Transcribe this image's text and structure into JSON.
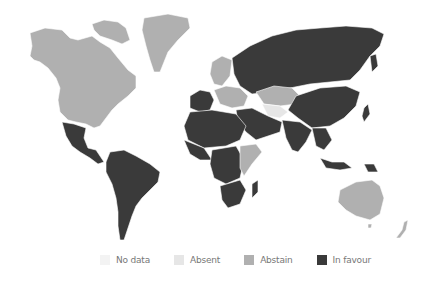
{
  "map": {
    "type": "choropleth world map",
    "colors": {
      "no_data": "#f3f3f3",
      "absent": "#e6e6e6",
      "abstain": "#b0b0b0",
      "in_favour": "#3a3a3a"
    },
    "regions": {
      "north_america": "abstain",
      "greenland": "abstain",
      "mexico_central_america": "in_favour",
      "south_america": "in_favour",
      "europe_west": "in_favour",
      "europe_north": "abstain",
      "europe_central": "abstain",
      "russia": "in_favour",
      "kazakhstan": "abstain",
      "central_asia_south": "absent",
      "middle_east": "in_favour",
      "north_africa": "in_favour",
      "west_africa": "in_favour",
      "central_africa": "in_favour",
      "east_africa": "abstain",
      "southern_africa": "in_favour",
      "madagascar": "in_favour",
      "south_asia": "in_favour",
      "china": "in_favour",
      "southeast_asia": "in_favour",
      "japan": "in_favour",
      "australia": "abstain",
      "new_zealand": "abstain"
    }
  },
  "legend": {
    "items": [
      {
        "key": "no_data",
        "label": "No data",
        "color": "#f3f3f3"
      },
      {
        "key": "absent",
        "label": "Absent",
        "color": "#e6e6e6"
      },
      {
        "key": "abstain",
        "label": "Abstain",
        "color": "#b0b0b0"
      },
      {
        "key": "in_favour",
        "label": "In favour",
        "color": "#3a3a3a"
      }
    ]
  }
}
